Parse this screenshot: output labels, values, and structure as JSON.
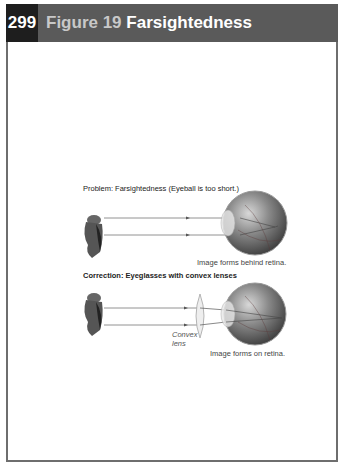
{
  "header": {
    "page_number": "299",
    "figure_label": "Figure 19",
    "title": "Farsightedness"
  },
  "diagram": {
    "problem": {
      "caption": "Problem: Farsightedness (Eyeball is too short.)",
      "result_label": "Image forms behind retina."
    },
    "correction": {
      "caption": "Correction: Eyeglasses with convex lenses",
      "lens_label_line1": "Convex",
      "lens_label_line2": "lens",
      "result_label": "Image forms on retina."
    },
    "icons": [
      "owl-object-icon",
      "eyeball-icon",
      "convex-lens-icon"
    ]
  }
}
